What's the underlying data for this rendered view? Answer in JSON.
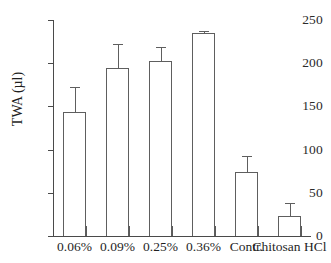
{
  "chart_data": {
    "type": "bar",
    "title": "",
    "xlabel": "",
    "ylabel": "TWA (µl)",
    "categories": [
      "0.06%",
      "0.09%",
      "0.25%",
      "0.36%",
      "Contr.",
      "Chitosan HCl"
    ],
    "values": [
      143,
      195,
      203,
      235,
      74,
      23
    ],
    "errors": [
      30,
      27,
      16,
      2,
      19,
      15
    ],
    "ylim": [
      0,
      250
    ],
    "yticks": [
      0,
      50,
      100,
      150,
      200,
      250
    ],
    "ytick_labels": [
      "0",
      "50",
      "100",
      "150",
      "200",
      "250"
    ],
    "grid": false,
    "legend": "none",
    "bar_fill": "#ffffff",
    "bar_edge": "#5e5e5e",
    "axis_color": "#4a4a4a"
  },
  "axis": {
    "y_title": "TWA (µl)"
  }
}
